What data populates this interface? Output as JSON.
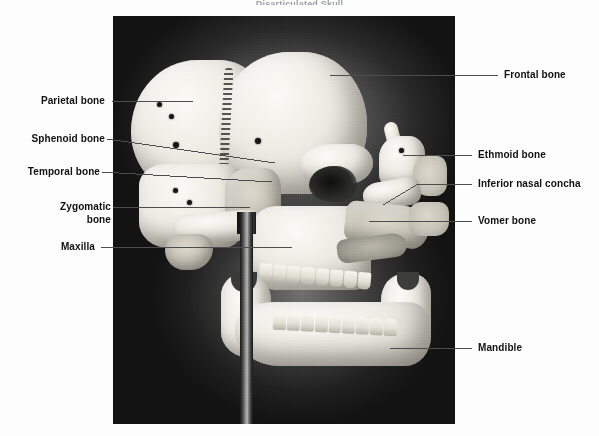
{
  "figure": {
    "title_sliver": "Disarticulated Skull",
    "photo": {
      "alt": "black-and-white photograph of a disarticulated human skull in lateral view mounted on a stand",
      "plate_bg_color": "#0a0a0a",
      "bone_color": "#e9e7e0"
    }
  },
  "labels": {
    "left": [
      {
        "id": "parietal",
        "text": "Parietal bone",
        "line2": ""
      },
      {
        "id": "sphenoid",
        "text": "Sphenoid bone",
        "line2": ""
      },
      {
        "id": "temporal",
        "text": "Temporal bone",
        "line2": ""
      },
      {
        "id": "zygomatic",
        "text": "Zygomatic",
        "line2": "bone"
      },
      {
        "id": "maxilla",
        "text": "Maxilla",
        "line2": ""
      }
    ],
    "right": [
      {
        "id": "frontal",
        "text": "Frontal bone",
        "line2": ""
      },
      {
        "id": "ethmoid",
        "text": "Ethmoid bone",
        "line2": ""
      },
      {
        "id": "concha",
        "text": "Inferior nasal concha",
        "line2": ""
      },
      {
        "id": "vomer",
        "text": "Vomer bone",
        "line2": ""
      },
      {
        "id": "mandible",
        "text": "Mandible",
        "line2": ""
      }
    ]
  },
  "style": {
    "leader_color": "#4d4d4d",
    "label_color": "#111111"
  }
}
